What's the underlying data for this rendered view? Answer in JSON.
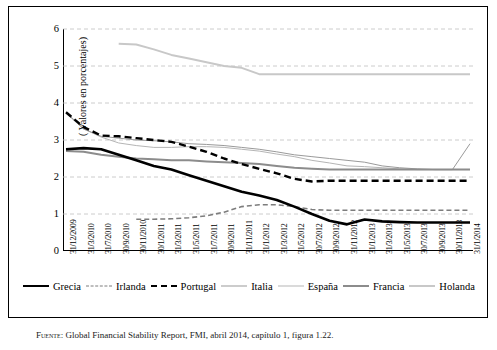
{
  "chart_data": {
    "type": "line",
    "title": "",
    "xlabel": "",
    "ylabel": "( Valores en porcentajes)",
    "ylim": [
      0,
      6
    ],
    "yticks": [
      0,
      1,
      2,
      3,
      4,
      5,
      6
    ],
    "grid": true,
    "legend_position": "bottom",
    "categories": [
      "31/12/2009",
      "31/3/2010",
      "31/7/2010",
      "30/9/2010",
      "30/11/2010",
      "30/1/2011",
      "31/3/2011",
      "31/5/2011",
      "31/7/2011",
      "30/9/2011",
      "31/11/2011",
      "31/1/2012",
      "31/3/2012",
      "31/5/2012",
      "30/7/2012",
      "30/9/2012",
      "31/11/2012",
      "31/1/2013",
      "31/3/2013",
      "31/5/2013",
      "30/7/2013",
      "30/9/2013",
      "30/11/2013",
      "31/1/2014"
    ],
    "series": [
      {
        "name": "Grecia",
        "color": "#000000",
        "style": "solid",
        "width": 2.6,
        "values": [
          2.75,
          2.78,
          2.75,
          2.6,
          2.45,
          2.3,
          2.2,
          2.05,
          1.9,
          1.75,
          1.6,
          1.5,
          1.38,
          1.2,
          1.0,
          0.82,
          0.72,
          0.85,
          0.8,
          0.78,
          0.77,
          0.77,
          0.77,
          0.77
        ]
      },
      {
        "name": "Irlanda",
        "color": "#7d7d7d",
        "style": "dashed",
        "width": 1.6,
        "values": [
          null,
          null,
          null,
          null,
          0.86,
          0.86,
          0.87,
          0.9,
          0.95,
          1.05,
          1.2,
          1.25,
          1.25,
          1.2,
          1.12,
          1.1,
          1.1,
          1.1,
          1.1,
          1.1,
          1.1,
          1.1,
          1.1,
          1.1
        ]
      },
      {
        "name": "Portugal",
        "color": "#000000",
        "style": "dashed",
        "width": 2.4,
        "values": [
          3.75,
          3.35,
          3.12,
          3.1,
          3.05,
          3.0,
          2.95,
          2.82,
          2.68,
          2.5,
          2.35,
          2.22,
          2.1,
          1.95,
          1.88,
          1.9,
          1.9,
          1.9,
          1.9,
          1.9,
          1.9,
          1.9,
          1.9,
          1.9
        ]
      },
      {
        "name": "Italia",
        "color": "#9a9a9a",
        "style": "solid",
        "width": 1.0,
        "values": [
          3.75,
          3.3,
          3.1,
          3.05,
          3.0,
          2.98,
          2.95,
          2.9,
          2.88,
          2.85,
          2.8,
          2.75,
          2.68,
          2.6,
          2.55,
          2.5,
          2.45,
          2.4,
          2.3,
          2.25,
          2.22,
          2.2,
          2.2,
          2.9
        ]
      },
      {
        "name": "España",
        "color": "#b5b5b5",
        "style": "solid",
        "width": 1.0,
        "values": [
          3.72,
          3.3,
          3.08,
          2.92,
          2.85,
          2.8,
          2.8,
          2.82,
          2.82,
          2.8,
          2.75,
          2.7,
          2.62,
          2.55,
          2.45,
          2.38,
          2.3,
          2.28,
          2.25,
          2.22,
          2.2,
          2.2,
          2.2,
          2.2
        ]
      },
      {
        "name": "Francia",
        "color": "#8c8c8c",
        "style": "solid",
        "width": 2.0,
        "values": [
          2.7,
          2.68,
          2.6,
          2.55,
          2.5,
          2.48,
          2.45,
          2.45,
          2.42,
          2.4,
          2.38,
          2.35,
          2.3,
          2.25,
          2.22,
          2.2,
          2.2,
          2.2,
          2.2,
          2.2,
          2.2,
          2.2,
          2.2,
          2.2
        ]
      },
      {
        "name": "Holanda",
        "color": "#c8c8c8",
        "style": "solid",
        "width": 2.0,
        "values": [
          null,
          null,
          null,
          5.6,
          5.58,
          5.45,
          5.3,
          5.2,
          5.1,
          5.0,
          4.95,
          4.78,
          4.78,
          4.78,
          4.78,
          4.78,
          4.78,
          4.78,
          4.78,
          4.78,
          4.78,
          4.78,
          4.78,
          4.78
        ]
      }
    ]
  },
  "caption": {
    "source_label": "Fuente:",
    "text": "Global Financial Stability Report, FMI, abril 2014, capítulo 1, figura 1.22."
  }
}
